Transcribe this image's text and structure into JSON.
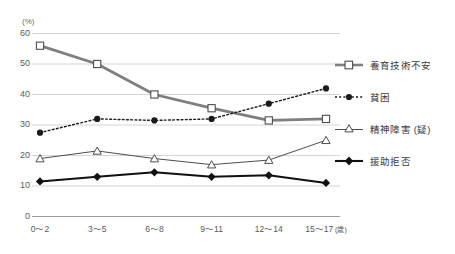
{
  "chart_data": {
    "type": "line",
    "title": "",
    "xlabel": "(歳)",
    "ylabel": "(%)",
    "ylim": [
      0,
      60
    ],
    "yticks": [
      0,
      10,
      20,
      30,
      40,
      50,
      60
    ],
    "grid": true,
    "legend_position": "right",
    "categories": [
      "0〜2",
      "3〜5",
      "6〜8",
      "9〜11",
      "12〜14",
      "15〜17"
    ],
    "series": [
      {
        "name": "養育技術不安",
        "marker": "open-square",
        "line_style": "solid-thick",
        "color": "#7f7f7f",
        "values": [
          56,
          50,
          40,
          35.5,
          31.5,
          32
        ]
      },
      {
        "name": "貧困",
        "marker": "filled-circle",
        "line_style": "dotted",
        "color": "#1a1a1a",
        "values": [
          27.5,
          32,
          31.5,
          32,
          37,
          42
        ]
      },
      {
        "name": "精神障害(疑)",
        "marker": "open-triangle",
        "line_style": "solid-thin",
        "color": "#4d4d4d",
        "values": [
          19,
          21.5,
          19,
          17,
          18.5,
          25
        ]
      },
      {
        "name": "援助拒否",
        "marker": "filled-diamond",
        "line_style": "solid-bold",
        "color": "#111111",
        "values": [
          11.5,
          13,
          14.5,
          13,
          13.5,
          11
        ]
      }
    ]
  },
  "axis": {
    "unit_label": "(%)",
    "x_unit_label": "(歳)"
  },
  "legend": {
    "items": [
      {
        "label": "養育技術不安"
      },
      {
        "label": "貧困"
      },
      {
        "label": "精神障害 (疑)"
      },
      {
        "label": "援助拒否"
      }
    ]
  }
}
